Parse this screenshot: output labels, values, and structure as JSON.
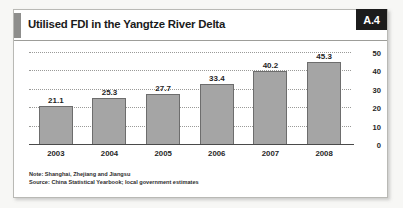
{
  "figure": {
    "title": "Utilised FDI in the Yangtze River Delta",
    "badge": "A.4",
    "accent_color": "#8e8e8c",
    "badge_bg": "#1c1c1c",
    "bar_color": "#a5a5a5",
    "bar_border_color": "#6d6d6d"
  },
  "notes": {
    "note": "Note: Shanghai, Zhejiang and Jiangsu",
    "source": "Source: China Statistical Yearbook; local government estimates"
  },
  "chart_data": {
    "type": "bar",
    "title": "Utilised FDI in the Yangtze River Delta",
    "xlabel": "",
    "ylabel": "",
    "categories": [
      "2003",
      "2004",
      "2005",
      "2006",
      "2007",
      "2008"
    ],
    "values": [
      21.1,
      25.3,
      27.7,
      33.4,
      40.2,
      45.3
    ],
    "value_labels": [
      "21.1",
      "25.3",
      "27.7",
      "33.4",
      "40.2",
      "45.3"
    ],
    "ylim": [
      0,
      50
    ],
    "yticks": [
      50,
      40,
      30,
      20,
      10,
      0
    ],
    "ytick_labels": [
      "50",
      "40",
      "30",
      "20",
      "10",
      "0"
    ],
    "grid": true,
    "grid_style": "dotted",
    "y_axis_position": "right",
    "legend": "none",
    "series": [
      {
        "name": "Utilised FDI",
        "values": [
          21.1,
          25.3,
          27.7,
          33.4,
          40.2,
          45.3
        ]
      }
    ]
  }
}
